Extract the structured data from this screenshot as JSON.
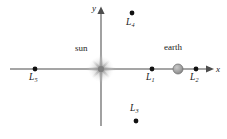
{
  "figure": {
    "background_color": "#ffffff",
    "width": 227,
    "height": 139
  },
  "axes": {
    "x_axis": {
      "label": "x",
      "label_x": 217,
      "label_y": 71,
      "y_pixel": 69,
      "x_start": 10,
      "x_end": 213,
      "color": "#4d4d4d",
      "arrow": "right"
    },
    "y_axis": {
      "label": "y",
      "label_x": 93,
      "label_y": 6,
      "x_pixel": 101,
      "y_start": 8,
      "y_end": 126,
      "color": "#4d4d4d",
      "arrow": "up"
    },
    "origin": {
      "x": 101,
      "y": 69
    }
  },
  "bodies": [
    {
      "name": "sun",
      "label": "sun",
      "label_x": 75,
      "label_y": 46,
      "marker": "starburst",
      "x": 101,
      "y": 69,
      "radius": 14,
      "color": "#9e9e9e"
    },
    {
      "name": "earth",
      "label": "earth",
      "label_x": 165,
      "label_y": 45,
      "marker": "circle",
      "x": 178,
      "y": 69,
      "radius": 5,
      "color": "#a6a6a6",
      "stroke": "#5a5a5a"
    }
  ],
  "lagrange_points": [
    {
      "id": "L1",
      "base": "L",
      "sub": "1",
      "x": 152,
      "y": 69,
      "label_x": 146,
      "label_y": 73,
      "label_position": "below",
      "dot_radius": 2.4,
      "color": "#111111"
    },
    {
      "id": "L2",
      "base": "L",
      "sub": "2",
      "x": 196,
      "y": 69,
      "label_x": 190,
      "label_y": 73,
      "label_position": "below",
      "dot_radius": 2.4,
      "color": "#111111"
    },
    {
      "id": "L3",
      "base": "L",
      "sub": "3",
      "x": 136,
      "y": 121,
      "label_x": 130,
      "label_y": 105,
      "label_position": "above",
      "dot_radius": 2.4,
      "color": "#111111"
    },
    {
      "id": "L4",
      "base": "L",
      "sub": "4",
      "x": 132,
      "y": 13,
      "label_x": 126,
      "label_y": 18,
      "label_position": "below",
      "dot_radius": 2.4,
      "color": "#111111"
    },
    {
      "id": "L5",
      "base": "L",
      "sub": "5",
      "x": 35,
      "y": 69,
      "label_x": 29,
      "label_y": 73,
      "label_position": "below",
      "dot_radius": 2.4,
      "color": "#111111"
    }
  ],
  "colors": {
    "axis": "#4d4d4d",
    "point": "#111111",
    "sun": "#9e9e9e",
    "earth": "#a6a6a6",
    "text": "#1a1a1a"
  }
}
